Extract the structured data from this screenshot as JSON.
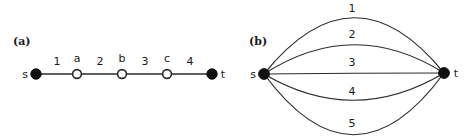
{
  "figure": {
    "background_color": "#ffffff",
    "ink_color": "#2b2b2b",
    "node_fill_color": "#111111",
    "node_hollow_fill": "#ffffff",
    "panels": [
      {
        "caption": "(a)",
        "type": "path-graph",
        "terminal_nodes": [
          {
            "label": "s",
            "x": 36,
            "y": 74,
            "style": "filled"
          },
          {
            "label": "t",
            "x": 212,
            "y": 74,
            "style": "filled"
          }
        ],
        "intermediate_nodes": [
          {
            "label": "a",
            "x": 77,
            "y": 74,
            "style": "hollow"
          },
          {
            "label": "b",
            "x": 122,
            "y": 74,
            "style": "hollow"
          },
          {
            "label": "c",
            "x": 167,
            "y": 74,
            "style": "hollow"
          }
        ],
        "edges": [
          {
            "label": "1",
            "from": "s",
            "to": "a",
            "label_x": 57,
            "label_y": 65
          },
          {
            "label": "2",
            "from": "a",
            "to": "b",
            "label_x": 100,
            "label_y": 65
          },
          {
            "label": "3",
            "from": "b",
            "to": "c",
            "label_x": 145,
            "label_y": 65
          },
          {
            "label": "4",
            "from": "c",
            "to": "t",
            "label_x": 190,
            "label_y": 65
          }
        ]
      },
      {
        "caption": "(b)",
        "type": "multigraph",
        "terminal_nodes": [
          {
            "label": "s",
            "x": 264,
            "y": 74,
            "style": "filled"
          },
          {
            "label": "t",
            "x": 444,
            "y": 73,
            "style": "filled"
          }
        ],
        "edges": [
          {
            "label": "1",
            "from": "s",
            "to": "t",
            "curve_offset": -56,
            "label_x": 352,
            "label_y": 12
          },
          {
            "label": "2",
            "from": "s",
            "to": "t",
            "curve_offset": -29,
            "label_x": 352,
            "label_y": 38
          },
          {
            "label": "3",
            "from": "s",
            "to": "t",
            "curve_offset": 0,
            "label_x": 352,
            "label_y": 66
          },
          {
            "label": "4",
            "from": "s",
            "to": "t",
            "curve_offset": 30,
            "label_x": 352,
            "label_y": 95
          },
          {
            "label": "5",
            "from": "s",
            "to": "t",
            "curve_offset": 64,
            "label_x": 352,
            "label_y": 127
          }
        ]
      }
    ]
  }
}
